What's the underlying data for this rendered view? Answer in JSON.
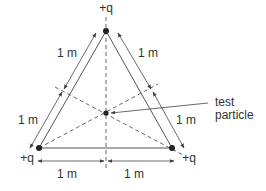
{
  "diagram": {
    "charges": {
      "top": "+q",
      "bottom_left": "+q",
      "bottom_right": "+q"
    },
    "dimensions": {
      "left_upper": "1 m",
      "left_lower": "1 m",
      "right_upper": "1 m",
      "right_lower": "1 m",
      "bottom_left": "1 m",
      "bottom_right": "1 m"
    },
    "test_particle_label": [
      "test",
      "particle"
    ],
    "colors": {
      "line": "#555555",
      "text": "#333333",
      "point": "#222222"
    }
  }
}
